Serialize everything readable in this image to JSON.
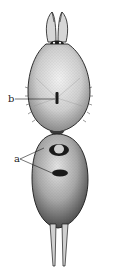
{
  "figure": {
    "type": "scientific-illustration",
    "labels": [
      {
        "id": "b",
        "text": "b",
        "points_to": "cephalothorax fovea"
      },
      {
        "id": "a",
        "text": "a",
        "points_to": "two dorsal abdominal markings"
      }
    ],
    "colors": {
      "ink": "#1a1a1a",
      "stipple_mid": "#9a9a9a",
      "stipple_light": "#d8d8d8",
      "background": "#ffffff"
    }
  }
}
